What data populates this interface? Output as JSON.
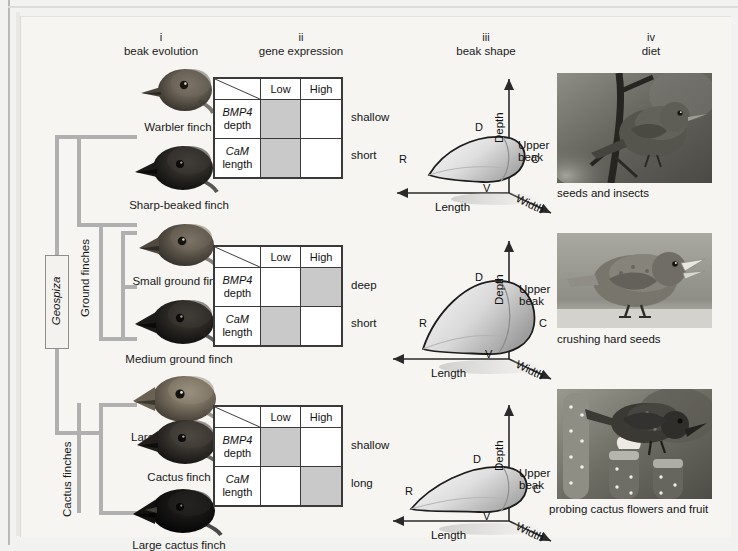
{
  "columns": [
    {
      "roman": "i",
      "name": "beak evolution"
    },
    {
      "roman": "ii",
      "name": "gene expression"
    },
    {
      "roman": "iii",
      "name": "beak shape"
    },
    {
      "roman": "iv",
      "name": "diet"
    }
  ],
  "tree": {
    "genus_label": "Geospiza",
    "group_labels": [
      {
        "label": "Ground finches"
      },
      {
        "label": "Cactus finches"
      }
    ]
  },
  "finches": [
    {
      "label": "Warbler finch"
    },
    {
      "label": "Sharp-beaked finch"
    },
    {
      "label": "Small ground finch"
    },
    {
      "label": "Medium ground finch"
    },
    {
      "label": "Large ground finch"
    },
    {
      "label": "Cactus finch"
    },
    {
      "label": "Large cactus finch"
    }
  ],
  "gene_tables": [
    {
      "col_headers": [
        "Low",
        "High"
      ],
      "rows": [
        {
          "gene": "BMP4",
          "trait": "depth",
          "low": true,
          "high": false,
          "outcome": "shallow"
        },
        {
          "gene": "CaM",
          "trait": "length",
          "low": true,
          "high": false,
          "outcome": "short"
        }
      ]
    },
    {
      "col_headers": [
        "Low",
        "High"
      ],
      "rows": [
        {
          "gene": "BMP4",
          "trait": "depth",
          "low": false,
          "high": true,
          "outcome": "deep"
        },
        {
          "gene": "CaM",
          "trait": "length",
          "low": true,
          "high": false,
          "outcome": "short"
        }
      ]
    },
    {
      "col_headers": [
        "Low",
        "High"
      ],
      "rows": [
        {
          "gene": "BMP4",
          "trait": "depth",
          "low": true,
          "high": false,
          "outcome": "shallow"
        },
        {
          "gene": "CaM",
          "trait": "length",
          "low": false,
          "high": true,
          "outcome": "long"
        }
      ]
    }
  ],
  "beak_shapes": [
    {
      "axis_depth": "Depth",
      "axis_length": "Length",
      "axis_width": "Width",
      "label_upper_beak": "Upper beak",
      "landmarks": {
        "R": "R",
        "D": "D",
        "V": "V",
        "C": "C"
      },
      "form": "long-shallow-pointed"
    },
    {
      "axis_depth": "Depth",
      "axis_length": "Length",
      "axis_width": "Width",
      "label_upper_beak": "Upper beak",
      "landmarks": {
        "R": "R",
        "D": "D",
        "V": "V",
        "C": "C"
      },
      "form": "deep-short-blunt"
    },
    {
      "axis_depth": "Depth",
      "axis_length": "Length",
      "axis_width": "Width",
      "label_upper_beak": "Upper beak",
      "landmarks": {
        "R": "R",
        "D": "D",
        "V": "V",
        "C": "C"
      },
      "form": "long-shallow-slender"
    }
  ],
  "diets": [
    {
      "caption": "seeds and insects",
      "scene": "finch perched on branch"
    },
    {
      "caption": "crushing hard seeds",
      "scene": "ground finch with open beak"
    },
    {
      "caption": "probing cactus flowers and fruit",
      "scene": "cactus finch on opuntia pads"
    }
  ],
  "colors": {
    "background": "#f6f5f2",
    "tree_branch": "#b0b0b0",
    "table_border": "#3a3a3a",
    "cell_shaded": "#c9c9c9",
    "text": "#141414"
  }
}
